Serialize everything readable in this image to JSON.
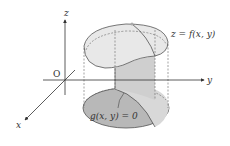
{
  "diagram": {
    "title": "",
    "axes": {
      "x_label": "x",
      "y_label": "y",
      "z_label": "z",
      "origin_label": "O"
    },
    "surface_label": "z = f(x, y)",
    "constraint_label": "g(x, y) = 0",
    "colors": {
      "line": "#444444",
      "top_surface_fill": "#e6e6e6",
      "bottom_region_fill": "#b4b4b4",
      "cylinder_fill": "#d2d2d2",
      "background": "#ffffff"
    }
  }
}
